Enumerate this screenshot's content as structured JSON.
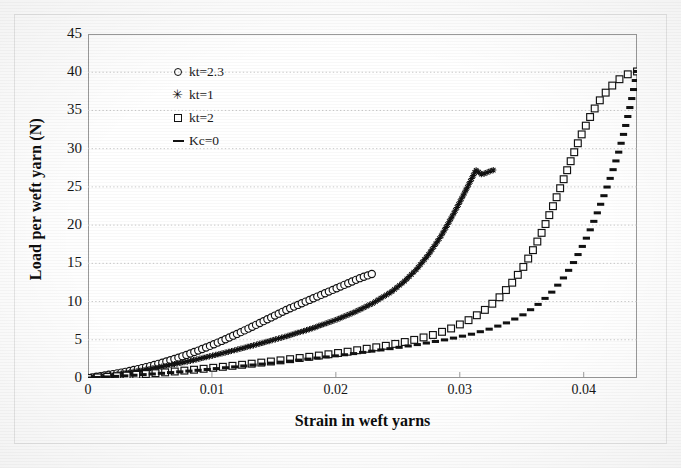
{
  "chart_data": {
    "type": "line",
    "title": "",
    "xlabel": "Strain in weft yarns",
    "ylabel": "Load per weft yarn  (N)",
    "xlim": [
      0,
      0.0443
    ],
    "ylim": [
      0,
      45
    ],
    "xticks": [
      "0",
      "0.01",
      "0.02",
      "0.03",
      "0.04"
    ],
    "xtick_values": [
      0,
      0.01,
      0.02,
      0.03,
      0.04
    ],
    "yticks": [
      "0",
      "5",
      "10",
      "15",
      "20",
      "25",
      "30",
      "35",
      "40",
      "45"
    ],
    "ytick_values": [
      0,
      5,
      10,
      15,
      20,
      25,
      30,
      35,
      40,
      45
    ],
    "grid": "horizontal",
    "legend_position": "upper-left-inside",
    "series": [
      {
        "name": "kt=2.3",
        "marker": "open-circle",
        "points": [
          [
            0.0,
            0.0
          ],
          [
            0.001,
            0.25
          ],
          [
            0.002,
            0.5
          ],
          [
            0.003,
            0.8
          ],
          [
            0.004,
            1.15
          ],
          [
            0.005,
            1.55
          ],
          [
            0.006,
            2.0
          ],
          [
            0.007,
            2.5
          ],
          [
            0.008,
            3.05
          ],
          [
            0.009,
            3.65
          ],
          [
            0.01,
            4.3
          ],
          [
            0.011,
            5.0
          ],
          [
            0.012,
            5.75
          ],
          [
            0.013,
            6.5
          ],
          [
            0.014,
            7.3
          ],
          [
            0.015,
            8.1
          ],
          [
            0.016,
            8.9
          ],
          [
            0.017,
            9.6
          ],
          [
            0.018,
            10.3
          ],
          [
            0.019,
            11.0
          ],
          [
            0.02,
            11.7
          ],
          [
            0.021,
            12.4
          ],
          [
            0.022,
            13.1
          ],
          [
            0.0229,
            13.6
          ]
        ]
      },
      {
        "name": "kt=1",
        "marker": "star",
        "points": [
          [
            0.0,
            0.0
          ],
          [
            0.002,
            0.4
          ],
          [
            0.004,
            0.9
          ],
          [
            0.006,
            1.5
          ],
          [
            0.008,
            2.15
          ],
          [
            0.01,
            2.9
          ],
          [
            0.012,
            3.7
          ],
          [
            0.014,
            4.55
          ],
          [
            0.016,
            5.45
          ],
          [
            0.018,
            6.45
          ],
          [
            0.02,
            7.6
          ],
          [
            0.0215,
            8.6
          ],
          [
            0.023,
            9.8
          ],
          [
            0.0245,
            11.3
          ],
          [
            0.0255,
            12.6
          ],
          [
            0.0265,
            14.2
          ],
          [
            0.0275,
            16.2
          ],
          [
            0.0285,
            18.6
          ],
          [
            0.0292,
            20.6
          ],
          [
            0.0299,
            22.7
          ],
          [
            0.0305,
            24.6
          ],
          [
            0.031,
            26.2
          ],
          [
            0.0313,
            27.2
          ],
          [
            0.0318,
            26.6
          ],
          [
            0.0322,
            26.9
          ],
          [
            0.0327,
            27.2
          ]
        ]
      },
      {
        "name": "kt=2",
        "marker": "open-square",
        "points": [
          [
            0.0,
            0.0
          ],
          [
            0.003,
            0.3
          ],
          [
            0.006,
            0.7
          ],
          [
            0.009,
            1.15
          ],
          [
            0.012,
            1.65
          ],
          [
            0.015,
            2.2
          ],
          [
            0.018,
            2.8
          ],
          [
            0.021,
            3.45
          ],
          [
            0.024,
            4.2
          ],
          [
            0.026,
            4.85
          ],
          [
            0.028,
            5.7
          ],
          [
            0.0295,
            6.6
          ],
          [
            0.031,
            7.8
          ],
          [
            0.0322,
            9.1
          ],
          [
            0.0333,
            10.7
          ],
          [
            0.0343,
            12.6
          ],
          [
            0.0352,
            14.7
          ],
          [
            0.036,
            17.0
          ],
          [
            0.0367,
            19.3
          ],
          [
            0.0373,
            21.6
          ],
          [
            0.0379,
            24.0
          ],
          [
            0.0385,
            26.5
          ],
          [
            0.0391,
            29.0
          ],
          [
            0.0397,
            31.4
          ],
          [
            0.0404,
            33.8
          ],
          [
            0.0411,
            35.9
          ],
          [
            0.0419,
            37.6
          ],
          [
            0.0427,
            38.9
          ],
          [
            0.0435,
            39.7
          ],
          [
            0.0443,
            40.1
          ]
        ]
      },
      {
        "name": "Kc=0",
        "marker": "dash",
        "points": [
          [
            0.0,
            0.0
          ],
          [
            0.003,
            0.28
          ],
          [
            0.006,
            0.62
          ],
          [
            0.009,
            1.02
          ],
          [
            0.012,
            1.48
          ],
          [
            0.015,
            1.98
          ],
          [
            0.018,
            2.52
          ],
          [
            0.021,
            3.1
          ],
          [
            0.024,
            3.75
          ],
          [
            0.0265,
            4.35
          ],
          [
            0.029,
            5.05
          ],
          [
            0.031,
            5.75
          ],
          [
            0.0325,
            6.45
          ],
          [
            0.034,
            7.35
          ],
          [
            0.0352,
            8.35
          ],
          [
            0.0363,
            9.6
          ],
          [
            0.0373,
            11.0
          ],
          [
            0.0382,
            12.7
          ],
          [
            0.039,
            14.6
          ],
          [
            0.0397,
            16.6
          ],
          [
            0.0404,
            18.9
          ],
          [
            0.041,
            21.2
          ],
          [
            0.0416,
            23.7
          ],
          [
            0.0422,
            26.4
          ],
          [
            0.0428,
            29.4
          ],
          [
            0.0433,
            32.4
          ],
          [
            0.0437,
            35.2
          ],
          [
            0.044,
            37.5
          ],
          [
            0.0442,
            39.2
          ],
          [
            0.0443,
            40.1
          ]
        ]
      }
    ],
    "legend": [
      {
        "label": "kt=2.3",
        "marker": "open-circle"
      },
      {
        "label": "kt=1",
        "marker": "star"
      },
      {
        "label": "kt=2",
        "marker": "open-square"
      },
      {
        "label": "Kc=0",
        "marker": "dash"
      }
    ],
    "colors": {
      "series_ink": "#111111",
      "grid": "#c9c9c9",
      "frame": "#8f8f8f",
      "background": "#ffffff",
      "text": "#111111"
    }
  }
}
